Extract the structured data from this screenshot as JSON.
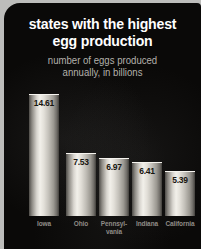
{
  "chart_data": {
    "type": "bar",
    "title": "states with the highest egg production",
    "title_lines": [
      "states with the highest",
      "egg production"
    ],
    "subtitle": "number of eggs produced annually, in billions",
    "subtitle_lines": [
      "number of eggs produced",
      "annually, in billions"
    ],
    "xlabel": "",
    "ylabel": "number of eggs produced annually, in billions",
    "ylim": [
      0,
      14.61
    ],
    "grid": false,
    "legend": false,
    "categories": [
      "Iowa",
      "Ohio",
      "Pennsylvania",
      "Indiana",
      "California"
    ],
    "category_label_lines": [
      [
        "Iowa"
      ],
      [
        "Ohio"
      ],
      [
        "Pennsyl-",
        "vania"
      ],
      [
        "Indiana"
      ],
      [
        "California"
      ]
    ],
    "values": [
      14.61,
      7.53,
      6.97,
      6.41,
      5.39
    ],
    "value_labels": [
      "14.61",
      "7.53",
      "6.97",
      "6.41",
      "5.39"
    ],
    "units": "billions of eggs"
  },
  "colors": {
    "card_background": "#bdbdbb",
    "panel_background": "#0a0908",
    "title_text": "#ffffff",
    "subtitle_text": "#b4b1ac",
    "category_text": "#8f8c87",
    "value_text": "#17150f",
    "bar_highlight": "#f2f0ea",
    "bar_shadow": "#403e3a"
  }
}
